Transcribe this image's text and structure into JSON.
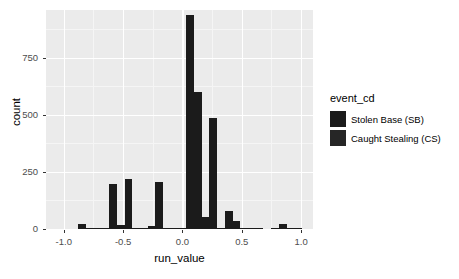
{
  "chart_data": {
    "type": "bar",
    "subtype": "histogram",
    "title": "",
    "xlabel": "run_value",
    "ylabel": "count",
    "xlim": [
      -1.15,
      1.1
    ],
    "ylim": [
      0,
      960
    ],
    "xticks": [
      -1.0,
      -0.5,
      0.0,
      0.5,
      1.0
    ],
    "xticklabels": [
      "-1.0",
      "-0.5",
      "0.0",
      "0.5",
      "1.0"
    ],
    "yticks": [
      0,
      250,
      500,
      750
    ],
    "yticklabels": [
      "0",
      "250",
      "500",
      "750"
    ],
    "grid": true,
    "grid_color": "#ffffff",
    "panel_background": "#ebebeb",
    "legend_position": "right",
    "binwidth": 0.065,
    "stacked": true,
    "legend": {
      "title": "event_cd",
      "entries": [
        {
          "label": "Stolen Base (SB)",
          "color": "#1b1b1b"
        },
        {
          "label": "Caught Stealing (CS)",
          "color": "#262626"
        }
      ]
    },
    "bins": [
      {
        "x": -0.875,
        "value": 0
      },
      {
        "x": -0.845,
        "value": 22
      },
      {
        "x": -0.78,
        "value": 4
      },
      {
        "x": -0.715,
        "value": 5
      },
      {
        "x": -0.65,
        "value": 3
      },
      {
        "x": -0.585,
        "value": 199
      },
      {
        "x": -0.52,
        "value": 18
      },
      {
        "x": -0.455,
        "value": 218
      },
      {
        "x": -0.39,
        "value": 3
      },
      {
        "x": -0.325,
        "value": 3
      },
      {
        "x": -0.26,
        "value": 12
      },
      {
        "x": -0.195,
        "value": 208
      },
      {
        "x": -0.13,
        "value": 3
      },
      {
        "x": -0.065,
        "value": 2
      },
      {
        "x": 0.0,
        "value": 2
      },
      {
        "x": 0.065,
        "value": 940
      },
      {
        "x": 0.13,
        "value": 600
      },
      {
        "x": 0.195,
        "value": 52
      },
      {
        "x": 0.26,
        "value": 488
      },
      {
        "x": 0.325,
        "value": 3
      },
      {
        "x": 0.39,
        "value": 78
      },
      {
        "x": 0.455,
        "value": 33
      },
      {
        "x": 0.52,
        "value": 6
      },
      {
        "x": 0.585,
        "value": 4
      },
      {
        "x": 0.65,
        "value": 3
      },
      {
        "x": 0.78,
        "value": 2
      },
      {
        "x": 0.845,
        "value": 20
      },
      {
        "x": 0.91,
        "value": 3
      },
      {
        "x": 0.975,
        "value": 2
      }
    ]
  }
}
